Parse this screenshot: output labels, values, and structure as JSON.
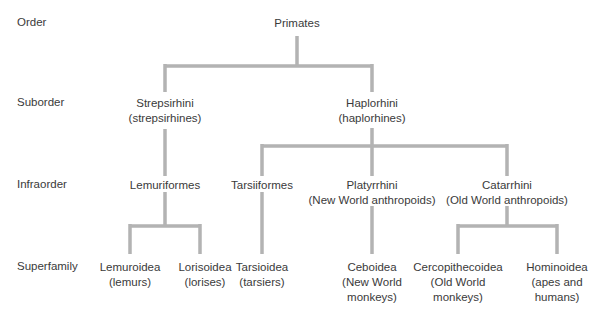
{
  "levels": {
    "order": "Order",
    "suborder": "Suborder",
    "infraorder": "Infraorder",
    "superfamily": "Superfamily"
  },
  "nodes": {
    "primates": {
      "name": "Primates"
    },
    "strepsirhini": {
      "name": "Strepsirhini",
      "common": "(strepsirhines)"
    },
    "haplorhini": {
      "name": "Haplorhini",
      "common": "(haplorhines)"
    },
    "lemuriformes": {
      "name": "Lemuriformes"
    },
    "tarsiiformes": {
      "name": "Tarsiiformes"
    },
    "platyrrhini": {
      "name": "Platyrrhini",
      "common": "(New World anthropoids)"
    },
    "catarrhini": {
      "name": "Catarrhini",
      "common": "(Old World anthropoids)"
    },
    "lemuroidea": {
      "name": "Lemuroidea",
      "common": "(lemurs)"
    },
    "lorisoidea": {
      "name": "Lorisoidea",
      "common": "(lorises)"
    },
    "tarsioidea": {
      "name": "Tarsioidea",
      "common": "(tarsiers)"
    },
    "ceboidea": {
      "name": "Ceboidea",
      "common1": "(New World",
      "common2": "monkeys)"
    },
    "cercopithecoidea": {
      "name": "Cercopithecoidea",
      "common1": "(Old World",
      "common2": "monkeys)"
    },
    "hominoidea": {
      "name": "Hominoidea",
      "common1": "(apes and",
      "common2": "humans)"
    }
  },
  "colors": {
    "line": "#b3b3b3",
    "text": "#3a3a3a"
  }
}
